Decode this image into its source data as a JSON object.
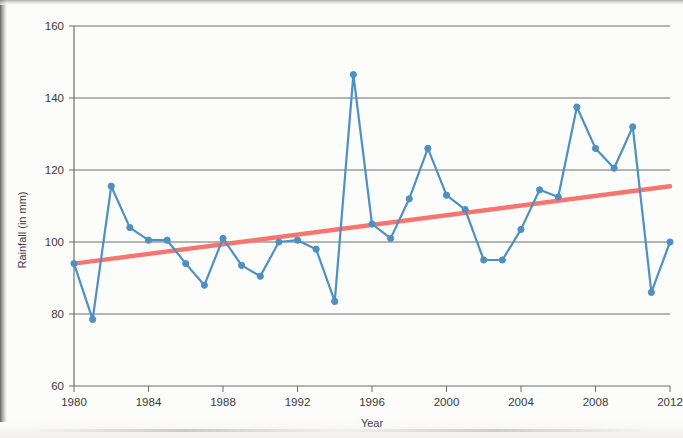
{
  "chart_data": {
    "type": "line",
    "title": "",
    "xlabel": "Year",
    "ylabel": "Rainfall (in mm)",
    "xlim": [
      1980,
      2012
    ],
    "ylim": [
      60,
      160
    ],
    "xticks": [
      1980,
      1984,
      1988,
      1992,
      1996,
      2000,
      2004,
      2008,
      2012
    ],
    "yticks": [
      60,
      80,
      100,
      120,
      140,
      160
    ],
    "grid": "horizontal",
    "legend": "none",
    "x": [
      1980,
      1981,
      1982,
      1983,
      1984,
      1985,
      1986,
      1987,
      1988,
      1989,
      1990,
      1991,
      1992,
      1993,
      1994,
      1995,
      1996,
      1997,
      1998,
      1999,
      2000,
      2001,
      2002,
      2003,
      2004,
      2005,
      2006,
      2007,
      2008,
      2009,
      2010,
      2011,
      2012
    ],
    "series": [
      {
        "name": "Rainfall",
        "type": "line",
        "color": "#4e90c2",
        "marker": "circle",
        "values": [
          94,
          78.5,
          115.5,
          104,
          100.5,
          100.5,
          94,
          88,
          101,
          93.5,
          90.5,
          100,
          100.5,
          98,
          83.5,
          146.5,
          105,
          101,
          112,
          126,
          113,
          109,
          95,
          95,
          103.5,
          114.5,
          112.5,
          137.5,
          126,
          120.5,
          132,
          86,
          100
        ]
      },
      {
        "name": "Trend line",
        "type": "trendline",
        "color": "#f7746f",
        "marker": "none",
        "endpoints": [
          [
            1980,
            94
          ],
          [
            2012,
            115.5
          ]
        ]
      }
    ]
  },
  "axis": {
    "y_label": "Rainfall (in mm)",
    "x_label": "Year",
    "y_tick_labels": [
      "160",
      "140",
      "120",
      "100",
      "80",
      "60"
    ],
    "x_tick_labels": [
      "1980",
      "1984",
      "1988",
      "1992",
      "1996",
      "2000",
      "2004",
      "2008",
      "2012"
    ]
  }
}
